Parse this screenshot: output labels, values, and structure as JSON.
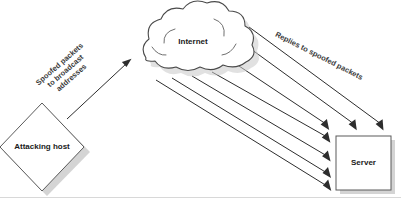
{
  "diagram": {
    "canvas": {
      "width": 401,
      "height": 201,
      "background": "#ffffff"
    },
    "colors": {
      "shape_stroke": "#5a5a5a",
      "cloud_stroke": "#4a4a4a",
      "arrow": "#2d2d2d",
      "shadow": "#b8b8b8",
      "label_text": "#1a1a1a",
      "flow_text": "#3a3a3a"
    },
    "nodes": [
      {
        "id": "attacking-host",
        "label": "Attacking host",
        "shape": "diamond",
        "cx": 42,
        "cy": 147,
        "half_width": 42,
        "half_height": 44
      },
      {
        "id": "internet-cloud",
        "label": "Internet",
        "shape": "cloud",
        "cx": 193,
        "cy": 42
      },
      {
        "id": "server",
        "label": "Server",
        "shape": "rectangle",
        "x": 336,
        "y": 136,
        "width": 55,
        "height": 54
      }
    ],
    "flows": [
      {
        "id": "spoofed-packets",
        "lines": [
          "Spoofed packets",
          "to broadcast",
          "addresses"
        ],
        "rotation": -41,
        "cx": 69,
        "cy": 75,
        "direction": "attacking-host-to-internet"
      },
      {
        "id": "replies-to-spoofed",
        "lines": [
          "Replies to spoofed packets"
        ],
        "rotation": 27,
        "cx": 318,
        "cy": 58,
        "direction": "internet-to-server"
      }
    ],
    "arrow_count_to_server": 7
  }
}
